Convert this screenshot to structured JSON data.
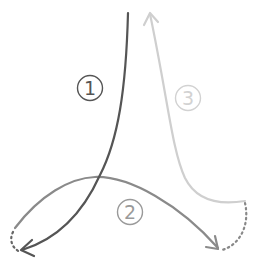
{
  "diagram": {
    "title": "",
    "colors": {
      "path1": "#555555",
      "path2": "#8a8a8a",
      "path3": "#cfcfcf",
      "background": "#ffffff"
    },
    "paths": [
      {
        "id": 1,
        "label": "①",
        "color": "#555555",
        "description": "dark curve from top center down to bottom-left arrowhead"
      },
      {
        "id": 2,
        "label": "②",
        "color": "#8a8a8a",
        "description": "arc from bottom-left over the middle to bottom-right arrowhead"
      },
      {
        "id": 3,
        "label": "③",
        "color": "#cfcfcf",
        "description": "light curve from bottom-right up to top arrowhead"
      }
    ],
    "connectors": [
      {
        "from": "path1-end",
        "to": "path2-start",
        "style": "dotted"
      },
      {
        "from": "path2-end",
        "to": "path3-start",
        "style": "dotted"
      }
    ]
  }
}
